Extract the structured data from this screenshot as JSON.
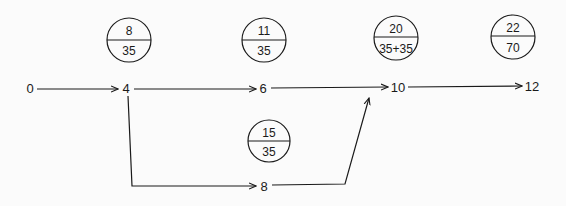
{
  "diagram": {
    "type": "network-path-diagram",
    "nodes": [
      {
        "id": "n0",
        "label": "0"
      },
      {
        "id": "n4",
        "label": "4"
      },
      {
        "id": "n6",
        "label": "6"
      },
      {
        "id": "n10",
        "label": "10"
      },
      {
        "id": "n12",
        "label": "12"
      },
      {
        "id": "n8",
        "label": "8"
      }
    ],
    "edges": [
      {
        "from": "0",
        "to": "4"
      },
      {
        "from": "4",
        "to": "6"
      },
      {
        "from": "6",
        "to": "10"
      },
      {
        "from": "10",
        "to": "12"
      },
      {
        "from": "4",
        "to": "8"
      },
      {
        "from": "8",
        "to": "10"
      }
    ],
    "annotations": [
      {
        "top": "8",
        "bottom": "35"
      },
      {
        "top": "11",
        "bottom": "35"
      },
      {
        "top": "20",
        "bottom": "35+35"
      },
      {
        "top": "22",
        "bottom": "70"
      },
      {
        "top": "15",
        "bottom": "35"
      }
    ],
    "colors": {
      "ink": "#1a1a1a",
      "background": "#fbfbfb"
    }
  }
}
